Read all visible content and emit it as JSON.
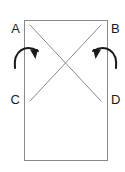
{
  "figure": {
    "type": "geometry-diagram",
    "colors": {
      "background": "#ffffff",
      "rectangle_stroke": "#8a8a8a",
      "diagonal_stroke": "#8a8a8a",
      "arrow_stroke": "#1a1a1a",
      "label_text": "#1a1a1a"
    },
    "rectangle": {
      "x": 24,
      "y": 20,
      "width": 83,
      "height": 140,
      "stroke_width": 1
    },
    "vertex_labels": [
      {
        "id": "A",
        "text": "A",
        "x": 20,
        "y": 30,
        "corner": "top-left"
      },
      {
        "id": "B",
        "text": "B",
        "x": 111,
        "y": 30,
        "corner": "top-right"
      },
      {
        "id": "C",
        "text": "C",
        "x": 20,
        "y": 101,
        "corner": "left"
      },
      {
        "id": "D",
        "text": "D",
        "x": 111,
        "y": 101,
        "corner": "right"
      }
    ],
    "diagonals": [
      {
        "id": "diagonal-a-d",
        "x1": 30,
        "y1": 25,
        "x2": 101,
        "y2": 101,
        "stroke_width": 1
      },
      {
        "id": "diagonal-b-c",
        "x1": 101,
        "y1": 25,
        "x2": 30,
        "y2": 101,
        "stroke_width": 1
      }
    ],
    "intersection": {
      "x": 65,
      "y": 62
    },
    "arrows": [
      {
        "id": "left-rotation-arrow",
        "direction": "clockwise",
        "path": "M 15,68 C 13,50 26,44 38,51",
        "head_points": "38,51 33,50 36,58",
        "stroke_width": 2
      },
      {
        "id": "right-rotation-arrow",
        "direction": "counter-clockwise",
        "path": "M 116,68 C 118,50 105,44 93,51",
        "head_points": "93,51 98,50 95,58",
        "stroke_width": 2
      }
    ]
  }
}
